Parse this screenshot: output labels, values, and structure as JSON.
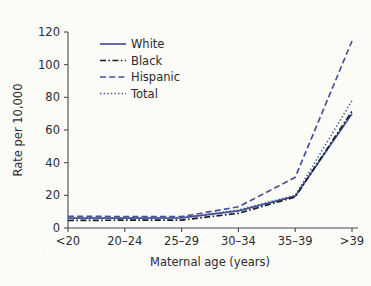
{
  "chart_data": {
    "type": "line",
    "title": "",
    "xlabel": "Maternal age (years)",
    "ylabel": "Rate per 10,000",
    "categories": [
      "<20",
      "20–24",
      "25–29",
      "30–34",
      "35–39",
      ">39"
    ],
    "ylim": [
      0,
      120
    ],
    "yticks": [
      0,
      20,
      40,
      60,
      80,
      100,
      120
    ],
    "ytick_labels": [
      "0",
      "20",
      "40",
      "60",
      "80",
      "100",
      "120"
    ],
    "grid": false,
    "legend_position": "upper left",
    "series": [
      {
        "name": "White",
        "values": [
          6.0,
          6.0,
          6.2,
          10.5,
          19.5,
          70.0
        ],
        "style": "solid",
        "color": "#45539C"
      },
      {
        "name": "Black",
        "values": [
          4.6,
          4.8,
          4.8,
          9.0,
          19.0,
          71.5
        ],
        "style": "dashdot",
        "color": "#1b1b28"
      },
      {
        "name": "Hispanic",
        "values": [
          7.2,
          7.0,
          7.0,
          13.0,
          31.0,
          114.5
        ],
        "style": "dashed",
        "color": "#45539C"
      },
      {
        "name": "Total",
        "values": [
          6.0,
          6.0,
          6.3,
          11.0,
          20.0,
          78.0
        ],
        "style": "dotted",
        "color": "#45539C"
      }
    ]
  },
  "legend": {
    "items": [
      {
        "label": "White"
      },
      {
        "label": "Black"
      },
      {
        "label": "Hispanic"
      },
      {
        "label": "Total"
      }
    ]
  },
  "colors": {
    "blue": "#45539C",
    "black": "#1b1b28",
    "axis": "#4a4a50",
    "text": "#2b2b30",
    "background": "#fbfbf8"
  }
}
